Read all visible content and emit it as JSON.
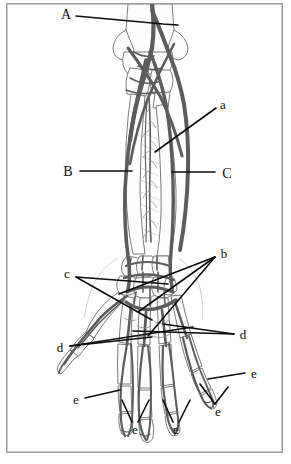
{
  "figure": {
    "background_color": "#ffffff",
    "frame_color": "#9a9a9a",
    "line_color": "#0c0c0c",
    "bone_outline_color": "#6e6e6e",
    "vessel_color": "#5a5a5a",
    "width": 291,
    "height": 464
  },
  "labels": [
    {
      "id": "A",
      "text": "A",
      "case": "upper",
      "x": 66,
      "y": 14
    },
    {
      "id": "a",
      "text": "a",
      "case": "lower",
      "x": 223,
      "y": 104
    },
    {
      "id": "B",
      "text": "B",
      "case": "upper",
      "x": 68,
      "y": 171
    },
    {
      "id": "C",
      "text": "C",
      "case": "upper",
      "x": 227,
      "y": 173
    },
    {
      "id": "b",
      "text": "b",
      "case": "lower",
      "x": 224,
      "y": 253
    },
    {
      "id": "c",
      "text": "c",
      "case": "lower",
      "x": 67,
      "y": 273
    },
    {
      "id": "d-right",
      "text": "d",
      "case": "lower",
      "x": 243,
      "y": 334
    },
    {
      "id": "d-left",
      "text": "d",
      "case": "lower",
      "x": 60,
      "y": 347
    },
    {
      "id": "e-right-upper",
      "text": "e",
      "case": "lower",
      "x": 254,
      "y": 373
    },
    {
      "id": "e-left",
      "text": "e",
      "case": "lower",
      "x": 76,
      "y": 399
    },
    {
      "id": "e-right-lower",
      "text": "e",
      "case": "lower",
      "x": 218,
      "y": 411
    },
    {
      "id": "e-mid-left",
      "text": "e",
      "case": "lower",
      "x": 135,
      "y": 429
    },
    {
      "id": "e-mid-right",
      "text": "e",
      "case": "lower",
      "x": 176,
      "y": 429
    }
  ],
  "leader_lines": [
    {
      "id": "leader-A",
      "from_label": "A",
      "points": "76,16 163,24 178,25"
    },
    {
      "id": "leader-a",
      "from_label": "a",
      "points": "216,108 155,152"
    },
    {
      "id": "leader-B",
      "from_label": "B",
      "points": "80,171 132,171"
    },
    {
      "id": "leader-C",
      "from_label": "C",
      "points": "215,172 172,172"
    },
    {
      "id": "leader-b-1",
      "from_label": "b",
      "points": "215,257 119,294"
    },
    {
      "id": "leader-b-2",
      "from_label": "b",
      "points": "215,257 138,312"
    },
    {
      "id": "leader-b-3",
      "from_label": "b",
      "points": "215,257 148,336"
    },
    {
      "id": "leader-c-1",
      "from_label": "c",
      "points": "76,277 168,284"
    },
    {
      "id": "leader-c-2",
      "from_label": "c",
      "points": "76,277 152,320"
    },
    {
      "id": "leader-d-right-1",
      "from_label": "d-right",
      "points": "234,334 133,331"
    },
    {
      "id": "leader-d-right-2",
      "from_label": "d-right",
      "points": "234,334 163,324"
    },
    {
      "id": "leader-d-left-1",
      "from_label": "d-left",
      "points": "70,346 193,327"
    },
    {
      "id": "leader-d-left-2",
      "from_label": "d-left",
      "points": "70,346 152,337"
    },
    {
      "id": "leader-e-left",
      "from_label": "e-left",
      "points": "85,398 120,390"
    },
    {
      "id": "leader-e-right-upper",
      "from_label": "e-right-upper",
      "points": "245,373 208,379"
    },
    {
      "id": "leader-e-right-lower-1",
      "from_label": "e-right-lower",
      "points": "215,404 200,384"
    },
    {
      "id": "leader-e-right-lower-2",
      "from_label": "e-right-lower",
      "points": "215,404 228,387"
    },
    {
      "id": "leader-e-mid-left-1",
      "from_label": "e-mid-left",
      "points": "132,422 122,400"
    },
    {
      "id": "leader-e-mid-left-2",
      "from_label": "e-mid-left",
      "points": "138,422 149,400"
    },
    {
      "id": "leader-e-mid-right-1",
      "from_label": "e-mid-right",
      "points": "173,422 163,400"
    },
    {
      "id": "leader-e-mid-right-2",
      "from_label": "e-mid-right",
      "points": "179,422 190,400"
    }
  ]
}
